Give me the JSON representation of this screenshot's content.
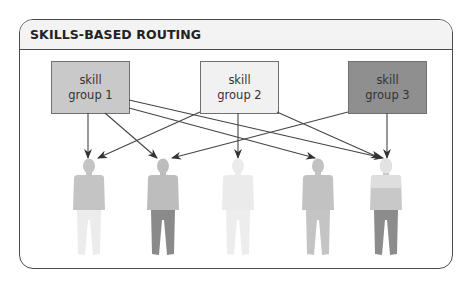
{
  "title": "SKILLS-BASED ROUTING",
  "skill_groups": [
    {
      "id": "g1",
      "line1": "skill",
      "line2": "group 1",
      "fill": "#c9c9c9",
      "text_color": "#333333"
    },
    {
      "id": "g2",
      "line1": "skill",
      "line2": "group 2",
      "fill": "#f1f1f1",
      "text_color": "#333333"
    },
    {
      "id": "g3",
      "line1": "skill",
      "line2": "group 3",
      "fill": "#8f8f8f",
      "text_color": "#2a2a2a"
    }
  ],
  "agents": [
    {
      "id": "agent-1",
      "top_color": "#c4c4c4",
      "bottom_color": "#ececec"
    },
    {
      "id": "agent-2",
      "top_color": "#bdbdbd",
      "bottom_color": "#8a8a8a"
    },
    {
      "id": "agent-3",
      "top_color": "#ececec",
      "bottom_color": "#ededed"
    },
    {
      "id": "agent-4",
      "top_color": "#c2c2c2",
      "bottom_color": "#c4c4c4"
    },
    {
      "id": "agent-5",
      "top_color": "#dddddd",
      "mid_color": "#c6c6c6",
      "bottom_color": "#8c8c8c"
    }
  ],
  "routes": [
    {
      "from": "skill group 1",
      "to": "agent-1"
    },
    {
      "from": "skill group 1",
      "to": "agent-2"
    },
    {
      "from": "skill group 1",
      "to": "agent-4"
    },
    {
      "from": "skill group 1",
      "to": "agent-5"
    },
    {
      "from": "skill group 2",
      "to": "agent-1"
    },
    {
      "from": "skill group 2",
      "to": "agent-3"
    },
    {
      "from": "skill group 2",
      "to": "agent-5"
    },
    {
      "from": "skill group 3",
      "to": "agent-2"
    },
    {
      "from": "skill group 3",
      "to": "agent-5"
    }
  ]
}
